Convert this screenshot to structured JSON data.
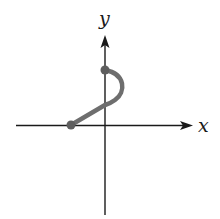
{
  "diagram": {
    "type": "parametric-curve-sketch",
    "axes": {
      "x_label": "x",
      "y_label": "y"
    },
    "curve": {
      "description": "Path starting at a point on the negative x-axis, rising linearly to the positive y-axis, then bulging right in a semicircular arc and ending at a higher point on the positive y-axis",
      "start_point": "on negative x-axis",
      "end_point": "on positive y-axis",
      "color": "#6e6e6e"
    },
    "colors": {
      "axis": "#1a1a1a",
      "curve": "#6e6e6e",
      "background": "#ffffff"
    }
  }
}
